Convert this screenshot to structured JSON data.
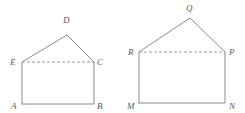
{
  "figure": {
    "background_color": "#ffffff",
    "stroke_color": "#8a8a8a",
    "dashed_stroke_color": "#9a9a9a",
    "label_color": "#5a5a5a"
  },
  "left_figure": {
    "name": "pentagon-ABCDE",
    "outline_points": "22,104 94,104 94,62 67,35 22,62 22,104",
    "dashed_segment": {
      "x1": 22,
      "y1": 62,
      "x2": 94,
      "y2": 62
    },
    "vertices": [
      {
        "id": "D",
        "label": "D",
        "x": 67,
        "y": 35,
        "label_x": 63,
        "label_y": 23
      },
      {
        "id": "E",
        "label": "E",
        "x": 22,
        "y": 62,
        "label_x": 10,
        "label_y": 65
      },
      {
        "id": "C",
        "label": "C",
        "x": 94,
        "y": 62,
        "label_x": 97,
        "label_y": 65
      },
      {
        "id": "A",
        "label": "A",
        "x": 22,
        "y": 104,
        "label_x": 11,
        "label_y": 109
      },
      {
        "id": "B",
        "label": "B",
        "x": 94,
        "y": 104,
        "label_x": 97,
        "label_y": 109
      }
    ]
  },
  "right_figure": {
    "name": "pentagon-MNPQR",
    "outline_points": "139,103 225,103 225,52 190,18 139,52 139,103",
    "dashed_segment": {
      "x1": 139,
      "y1": 52,
      "x2": 225,
      "y2": 52
    },
    "vertices": [
      {
        "id": "Q",
        "label": "Q",
        "x": 190,
        "y": 18,
        "label_x": 186,
        "label_y": 11
      },
      {
        "id": "R",
        "label": "R",
        "x": 139,
        "y": 52,
        "label_x": 128,
        "label_y": 55
      },
      {
        "id": "P",
        "label": "P",
        "x": 225,
        "y": 52,
        "label_x": 229,
        "label_y": 55
      },
      {
        "id": "M",
        "label": "M",
        "x": 139,
        "y": 103,
        "label_x": 127,
        "label_y": 109
      },
      {
        "id": "N",
        "label": "N",
        "x": 225,
        "y": 103,
        "label_x": 229,
        "label_y": 109
      }
    ]
  }
}
